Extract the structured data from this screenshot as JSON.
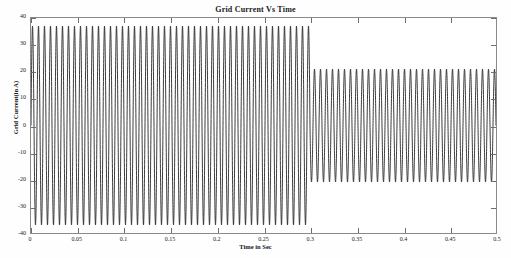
{
  "figure": {
    "background_color": "#ffffff",
    "axes_color": "#8a8a8a",
    "trace_color": "#262626"
  },
  "chart_data": {
    "type": "line",
    "title": "Grid Current Vs Time",
    "xlabel": "Time in Sec",
    "ylabel": "Grid Current(in A)",
    "xlim": [
      0,
      0.5
    ],
    "ylim": [
      -40,
      40
    ],
    "xticks": [
      0,
      0.05,
      0.1,
      0.15,
      0.2,
      0.25,
      0.3,
      0.35,
      0.4,
      0.45,
      0.5
    ],
    "xticklabels": [
      "0",
      "0.05",
      "0.1",
      "0.15",
      "0.2",
      "0.25",
      "0.3",
      "0.35",
      "0.4",
      "0.45",
      "0.5"
    ],
    "yticks": [
      -40,
      -30,
      -20,
      -10,
      0,
      10,
      20,
      30,
      40
    ],
    "yticklabels": [
      "-40",
      "-30",
      "-20",
      "-10",
      "0",
      "10",
      "20",
      "30",
      "40"
    ],
    "grid": false,
    "legend": null,
    "series": [
      {
        "name": "Grid Current",
        "waveform": "sinusoid",
        "frequency_hz": 155,
        "segments": [
          {
            "t_start": 0.0,
            "t_end": 0.3,
            "amplitude": 37.0,
            "description": "high amplitude grid current before step change"
          },
          {
            "t_start": 0.3,
            "t_end": 0.5,
            "amplitude": 21.0,
            "description": "reduced amplitude grid current after step change at 0.3 s"
          }
        ],
        "transition_time": 0.3,
        "peak_before": 37.0,
        "peak_after": 21.0,
        "min_before": -37.0,
        "min_after": -21.0
      }
    ]
  }
}
